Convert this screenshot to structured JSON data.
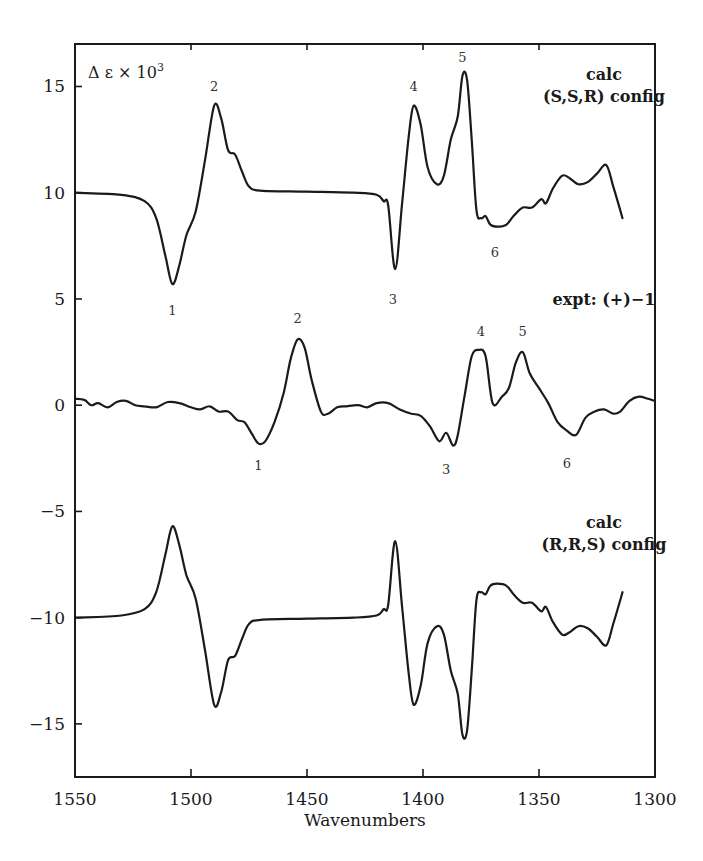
{
  "chart_data": {
    "type": "line",
    "title": "",
    "xlabel": "Wavenumbers",
    "ylabel": "Δ ε × 10^3",
    "ylabel_display": {
      "base": "Δ ε × 10",
      "sup": "3"
    },
    "xlim": [
      1550,
      1300
    ],
    "ylim": [
      -17.5,
      17
    ],
    "x_ticks": [
      1550,
      1500,
      1450,
      1400,
      1350,
      1300
    ],
    "x_tick_labels": [
      "1550",
      "1500",
      "1450",
      "1400",
      "1350",
      "1300"
    ],
    "y_ticks": [
      15,
      10,
      5,
      0,
      -5,
      -10,
      -15
    ],
    "y_tick_labels": [
      "15",
      "10",
      "5",
      "0",
      "−5",
      "−10",
      "−15"
    ],
    "grid": false,
    "legend": "none (panel annotations)",
    "series": [
      {
        "name": "calc (S,S,R) config",
        "label_lines": [
          "calc",
          "(S,S,R) config"
        ],
        "x": [
          1550,
          1530,
          1520,
          1515,
          1511,
          1508,
          1505,
          1502,
          1498,
          1494,
          1490,
          1487,
          1484,
          1481,
          1478,
          1475,
          1470,
          1450,
          1430,
          1420,
          1417,
          1415,
          1412,
          1409,
          1406,
          1404,
          1401,
          1398,
          1394,
          1391,
          1388,
          1385,
          1383,
          1381,
          1379,
          1377,
          1375,
          1373,
          1371,
          1368,
          1364,
          1361,
          1357,
          1353,
          1349,
          1347,
          1344,
          1340,
          1337,
          1333,
          1329,
          1325,
          1321,
          1318,
          1314
        ],
        "y": [
          10.0,
          9.9,
          9.6,
          8.8,
          7.0,
          5.7,
          6.6,
          8.0,
          9.1,
          11.5,
          14.1,
          13.5,
          12.0,
          11.8,
          11.0,
          10.3,
          10.1,
          10.05,
          10.0,
          9.9,
          9.6,
          9.4,
          6.4,
          9.5,
          12.8,
          14.1,
          13.2,
          11.2,
          10.4,
          10.8,
          12.5,
          13.6,
          15.5,
          15.3,
          12.5,
          9.2,
          8.8,
          8.9,
          8.5,
          8.4,
          8.5,
          8.9,
          9.3,
          9.3,
          9.7,
          9.5,
          10.2,
          10.8,
          10.7,
          10.4,
          10.5,
          10.9,
          11.3,
          10.3,
          8.8
        ],
        "peak_labels": [
          {
            "text": "1",
            "x": 1508,
            "y": 4.5
          },
          {
            "text": "2",
            "x": 1490,
            "y": 15.0
          },
          {
            "text": "3",
            "x": 1413,
            "y": 5.0
          },
          {
            "text": "4",
            "x": 1404,
            "y": 15.0
          },
          {
            "text": "5",
            "x": 1383,
            "y": 16.4
          },
          {
            "text": "6",
            "x": 1369,
            "y": 7.2
          }
        ]
      },
      {
        "name": "expt: (+)-1",
        "label_lines": [
          "expt: (+)−1"
        ],
        "x": [
          1550,
          1546,
          1543,
          1540,
          1536,
          1532,
          1528,
          1524,
          1520,
          1515,
          1510,
          1505,
          1500,
          1496,
          1492,
          1488,
          1484,
          1480,
          1477,
          1474,
          1471,
          1468,
          1464,
          1460,
          1457,
          1454,
          1451,
          1448,
          1444,
          1441,
          1437,
          1433,
          1428,
          1424,
          1420,
          1415,
          1410,
          1405,
          1401,
          1397,
          1393,
          1390,
          1387,
          1385,
          1382,
          1379,
          1376,
          1373,
          1370,
          1366,
          1363,
          1360,
          1357,
          1354,
          1350,
          1346,
          1342,
          1338,
          1334,
          1330,
          1326,
          1322,
          1318,
          1315,
          1311,
          1307,
          1303,
          1300
        ],
        "y": [
          0.3,
          0.25,
          0.0,
          0.1,
          -0.1,
          0.15,
          0.2,
          0.0,
          -0.05,
          -0.1,
          0.15,
          0.1,
          -0.1,
          -0.2,
          -0.05,
          -0.3,
          -0.3,
          -0.7,
          -0.8,
          -1.3,
          -1.8,
          -1.7,
          -0.8,
          0.6,
          2.2,
          3.1,
          2.7,
          1.2,
          -0.3,
          -0.4,
          -0.1,
          -0.05,
          0.0,
          -0.1,
          0.1,
          0.1,
          -0.2,
          -0.4,
          -0.5,
          -1.0,
          -1.7,
          -1.3,
          -1.9,
          -1.4,
          0.5,
          2.3,
          2.6,
          2.3,
          0.1,
          0.4,
          0.8,
          2.0,
          2.5,
          1.5,
          0.8,
          0.1,
          -0.8,
          -1.2,
          -1.4,
          -0.6,
          -0.3,
          -0.2,
          -0.4,
          -0.3,
          0.2,
          0.4,
          0.3,
          0.2
        ],
        "peak_labels": [
          {
            "text": "1",
            "x": 1471,
            "y": -2.8
          },
          {
            "text": "2",
            "x": 1454,
            "y": 4.1
          },
          {
            "text": "3",
            "x": 1390,
            "y": -3.0
          },
          {
            "text": "4",
            "x": 1375,
            "y": 3.5
          },
          {
            "text": "5",
            "x": 1357,
            "y": 3.5
          },
          {
            "text": "6",
            "x": 1338,
            "y": -2.7
          }
        ]
      },
      {
        "name": "calc (R,R,S) config",
        "label_lines": [
          "calc",
          "(R,R,S) config"
        ],
        "x": [
          1550,
          1530,
          1520,
          1515,
          1511,
          1508,
          1505,
          1502,
          1498,
          1494,
          1490,
          1487,
          1484,
          1481,
          1478,
          1475,
          1470,
          1450,
          1430,
          1420,
          1417,
          1415,
          1412,
          1409,
          1406,
          1404,
          1401,
          1398,
          1394,
          1391,
          1388,
          1385,
          1383,
          1381,
          1379,
          1377,
          1375,
          1373,
          1371,
          1368,
          1364,
          1361,
          1357,
          1353,
          1349,
          1347,
          1344,
          1340,
          1337,
          1333,
          1329,
          1325,
          1321,
          1318,
          1314
        ],
        "y": [
          -10.0,
          -9.9,
          -9.6,
          -8.8,
          -7.0,
          -5.7,
          -6.6,
          -8.0,
          -9.1,
          -11.5,
          -14.1,
          -13.5,
          -12.0,
          -11.8,
          -11.0,
          -10.3,
          -10.1,
          -10.05,
          -10.0,
          -9.9,
          -9.6,
          -9.4,
          -6.4,
          -9.5,
          -12.8,
          -14.1,
          -13.2,
          -11.2,
          -10.4,
          -10.8,
          -12.5,
          -13.6,
          -15.5,
          -15.3,
          -12.5,
          -9.2,
          -8.8,
          -8.9,
          -8.5,
          -8.4,
          -8.5,
          -8.9,
          -9.3,
          -9.3,
          -9.7,
          -9.5,
          -10.2,
          -10.8,
          -10.7,
          -10.4,
          -10.5,
          -10.9,
          -11.3,
          -10.3,
          -8.8
        ],
        "peak_labels": []
      }
    ],
    "panel_annotations": [
      {
        "lines": [
          "calc",
          "(S,S,R) config"
        ],
        "x": 1322,
        "y": 15.6
      },
      {
        "lines": [
          "expt: (+)−1"
        ],
        "x": 1322,
        "y": 5.0
      },
      {
        "lines": [
          "calc",
          "(R,R,S) config"
        ],
        "x": 1322,
        "y": -5.5
      }
    ]
  }
}
